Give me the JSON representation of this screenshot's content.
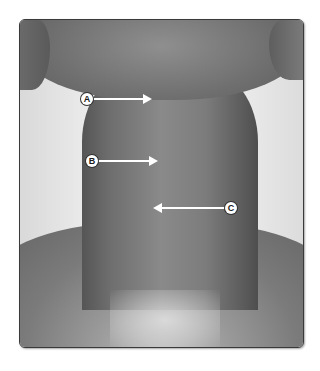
{
  "figure": {
    "labels": [
      {
        "id": "A",
        "text": "A",
        "badge_x": 81,
        "badge_y": 93,
        "arrow_from": 93,
        "arrow_to": 152,
        "arrow_y": 99,
        "direction": "right"
      },
      {
        "id": "B",
        "text": "B",
        "badge_x": 86,
        "badge_y": 155,
        "arrow_from": 98,
        "arrow_to": 158,
        "arrow_y": 161,
        "direction": "right"
      },
      {
        "id": "C",
        "text": "C",
        "badge_x": 225,
        "badge_y": 202,
        "arrow_from": 153,
        "arrow_to": 225,
        "arrow_y": 208,
        "direction": "left"
      }
    ],
    "colors": {
      "border": "#3a3a3a",
      "arrow": "#ffffff",
      "badge_bg": "#ffffff",
      "badge_text": "#1a1a1a"
    }
  }
}
